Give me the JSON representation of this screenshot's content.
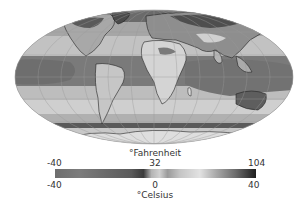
{
  "figure": {
    "type": "world temperature map",
    "projection": "Mollweide (elliptical)",
    "palette": "grayscale"
  },
  "legend": {
    "fahrenheit_label": "°Fahrenheit",
    "celsius_label": "°Celsius",
    "fahrenheit_ticks": [
      "-40",
      "32",
      "104"
    ],
    "celsius_ticks": [
      "-40",
      "0",
      "40"
    ],
    "range_celsius": [
      -40,
      40
    ],
    "range_fahrenheit": [
      -40,
      104
    ],
    "colorbar_stops": [
      {
        "pos": 0.0,
        "color": "#6e6e6e"
      },
      {
        "pos": 0.12,
        "color": "#7c7c7c"
      },
      {
        "pos": 0.25,
        "color": "#6a6a6a"
      },
      {
        "pos": 0.38,
        "color": "#5a5a5a"
      },
      {
        "pos": 0.44,
        "color": "#3a3a3a"
      },
      {
        "pos": 0.48,
        "color": "#b4b4b4"
      },
      {
        "pos": 0.52,
        "color": "#d0d0d0"
      },
      {
        "pos": 0.56,
        "color": "#9a9a9a"
      },
      {
        "pos": 0.62,
        "color": "#c4c4c4"
      },
      {
        "pos": 0.72,
        "color": "#e2e2e2"
      },
      {
        "pos": 0.8,
        "color": "#aaaaaa"
      },
      {
        "pos": 0.9,
        "color": "#6a6a6a"
      },
      {
        "pos": 1.0,
        "color": "#1e1e1e"
      }
    ]
  },
  "colors": {
    "ocean_polar": "#8c8c8c",
    "ocean_cool": "#bdbdbd",
    "ocean_warm": "#777777",
    "land_hot": "#d2d2d2",
    "land_cold": "#5a5a5a",
    "coastline": "#222222",
    "graticule": "#9a9a9a"
  }
}
